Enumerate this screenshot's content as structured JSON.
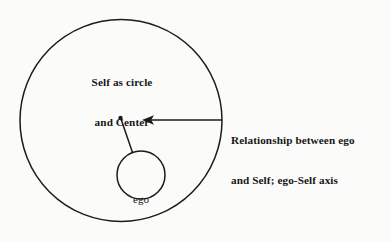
{
  "diagram": {
    "title_alt": "Self as circle and Center with ego",
    "background_color": "#fbfbfa",
    "ink_color": "#1b1b1b",
    "labels": {
      "self": {
        "line1": "Self as circle",
        "line2": "and Center"
      },
      "ego": {
        "text": "ego"
      },
      "relationship": {
        "line1": "Relationship between ego",
        "line2": "and Self; ego-Self axis"
      }
    },
    "shapes": {
      "outer_circle": {
        "name": "Self",
        "cx": 121,
        "cy": 120.5,
        "r": 101,
        "fill": "none",
        "stroke": "#1b1b1b",
        "stroke_width": 1.5
      },
      "inner_circle": {
        "name": "ego",
        "cx": 141,
        "cy": 175,
        "r": 24,
        "fill": "none",
        "stroke": "#1b1b1b",
        "stroke_width": 1.5
      },
      "center_dot": {
        "name": "Center",
        "cx": 120.5,
        "cy": 118,
        "r": 2.1,
        "fill": "#1b1b1b"
      },
      "axis_line": {
        "name": "ego-Self axis",
        "x1": 121,
        "y1": 119,
        "x2": 132.5,
        "y2": 152.5,
        "stroke": "#1b1b1b",
        "stroke_width": 1.5
      },
      "pointer_arrow": {
        "name": "annotation arrow",
        "x1": 222,
        "y1": 120,
        "x2": 143,
        "y2": 120,
        "stroke": "#1b1b1b",
        "stroke_width": 1.4,
        "head": "left"
      }
    }
  }
}
